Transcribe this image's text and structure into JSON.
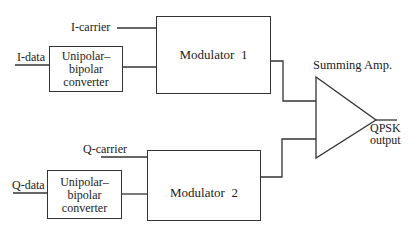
{
  "diagram": {
    "inputs": {
      "i_data": "I-data",
      "i_carrier": "I-carrier",
      "q_data": "Q-data",
      "q_carrier": "Q-carrier"
    },
    "blocks": {
      "converter_i": {
        "line1": "Unipolar–",
        "line2": "bipolar",
        "line3": "converter"
      },
      "converter_q": {
        "line1": "Unipolar–",
        "line2": "bipolar",
        "line3": "converter"
      },
      "modulator_1": "Modulator  1",
      "modulator_2": "Modulator  2",
      "summing_amp": "Summing Amp."
    },
    "output": {
      "line1": "QPSK",
      "line2": "output"
    },
    "line_color": "#333333"
  }
}
